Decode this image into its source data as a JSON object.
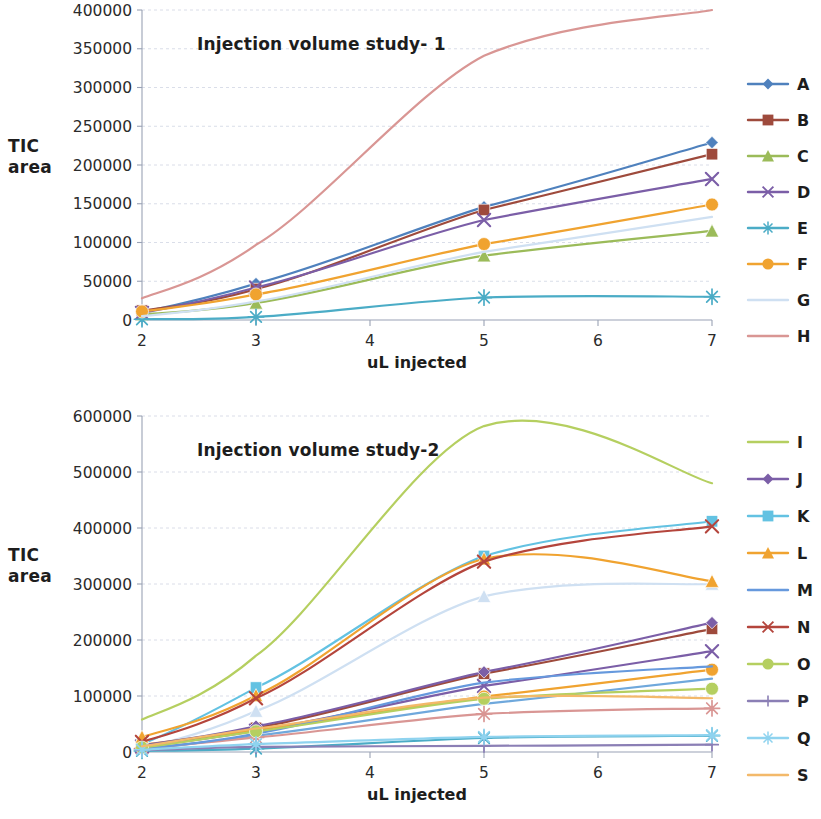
{
  "axis_label_text": "TIC\narea",
  "chart_data": [
    {
      "type": "line",
      "title": "Injection volume  study- 1",
      "xlabel": "uL injected",
      "ylabel": "TIC area",
      "x": [
        2,
        3,
        5,
        7
      ],
      "xlim": [
        2,
        7
      ],
      "ylim": [
        0,
        400000
      ],
      "xticks": [
        2,
        3,
        4,
        5,
        6,
        7
      ],
      "xticklabels": [
        "2",
        "3",
        "4",
        "5",
        "6",
        "7"
      ],
      "yticks": [
        0,
        50000,
        100000,
        150000,
        200000,
        250000,
        300000,
        350000,
        400000
      ],
      "yticklabels": [
        "0",
        "50000",
        "100000",
        "150000",
        "200000",
        "250000",
        "300000",
        "350000",
        "400000"
      ],
      "grid": true,
      "legend_position": "right",
      "series": [
        {
          "name": "A",
          "color": "#4f81bd",
          "marker": "diamond",
          "values": [
            10000,
            47000,
            146000,
            229000
          ]
        },
        {
          "name": "B",
          "color": "#9e4a3c",
          "marker": "square",
          "values": [
            12000,
            40000,
            142000,
            214000
          ]
        },
        {
          "name": "C",
          "color": "#9bbb59",
          "marker": "triangle",
          "values": [
            7000,
            22000,
            83000,
            115000
          ]
        },
        {
          "name": "D",
          "color": "#7b5ea7",
          "marker": "cross",
          "values": [
            9000,
            42000,
            129000,
            182000
          ]
        },
        {
          "name": "E",
          "color": "#4bacc6",
          "marker": "star",
          "values": [
            1000,
            4000,
            29000,
            30000
          ]
        },
        {
          "name": "F",
          "color": "#f0a330",
          "marker": "circle",
          "values": [
            11000,
            33000,
            98000,
            149000
          ]
        },
        {
          "name": "G",
          "color": "#cfe0f2",
          "marker": "none",
          "values": [
            5000,
            24000,
            88000,
            133000
          ]
        },
        {
          "name": "H",
          "color": "#d99694",
          "marker": "none",
          "values": [
            28000,
            97000,
            341000,
            400000
          ]
        }
      ]
    },
    {
      "type": "line",
      "title": "Injection volume  study-2",
      "xlabel": "uL injected",
      "ylabel": "TIC area",
      "x": [
        2,
        3,
        5,
        7
      ],
      "xlim": [
        2,
        7
      ],
      "ylim": [
        0,
        600000
      ],
      "xticks": [
        2,
        3,
        4,
        5,
        6,
        7
      ],
      "xticklabels": [
        "2",
        "3",
        "4",
        "5",
        "6",
        "7"
      ],
      "yticks": [
        0,
        100000,
        200000,
        300000,
        400000,
        500000,
        600000
      ],
      "yticklabels": [
        "0",
        "100000",
        "200000",
        "300000",
        "400000",
        "500000",
        "600000"
      ],
      "grid": true,
      "legend_position": "right",
      "series": [
        {
          "name": "I",
          "color": "#b5cf60",
          "marker": "none",
          "values": [
            58000,
            172000,
            582000,
            480000
          ]
        },
        {
          "name": "J",
          "color": "#7b5ea7",
          "marker": "diamond",
          "values": [
            12000,
            46000,
            143000,
            231000
          ]
        },
        {
          "name": "K",
          "color": "#63c2e2",
          "marker": "square",
          "values": [
            14000,
            115000,
            350000,
            412000
          ]
        },
        {
          "name": "L",
          "color": "#f0a330",
          "marker": "triangle",
          "values": [
            27000,
            101000,
            345000,
            305000
          ]
        },
        {
          "name": "M",
          "color": "#6699dd",
          "marker": "none",
          "values": [
            6000,
            33000,
            124000,
            153000
          ]
        },
        {
          "name": "N",
          "color": "#b4453c",
          "marker": "cross",
          "values": [
            18000,
            96000,
            340000,
            403000
          ]
        },
        {
          "name": "O",
          "color": "#b5cf60",
          "marker": "circle",
          "values": [
            8000,
            37000,
            95000,
            113000
          ]
        },
        {
          "name": "P",
          "color": "#8b7fb5",
          "marker": "plus",
          "values": [
            3000,
            9000,
            11000,
            13000
          ]
        },
        {
          "name": "Q",
          "color": "#8fd3ef",
          "marker": "star",
          "values": [
            4000,
            14000,
            27000,
            30000
          ]
        },
        {
          "name": "S",
          "color": "#f3b96a",
          "marker": "none",
          "values": [
            10000,
            42000,
            97000,
            96000
          ]
        }
      ],
      "extra_series": [
        {
          "name": "unlabeled-light-blue",
          "color": "#cfe0f2",
          "marker": "triangle",
          "values": [
            6000,
            73000,
            278000,
            300000
          ]
        },
        {
          "name": "unlabeled-brown",
          "color": "#9e4a3c",
          "marker": "square",
          "values": [
            11000,
            43000,
            140000,
            220000
          ]
        },
        {
          "name": "unlabeled-purple-x",
          "color": "#7b5ea7",
          "marker": "cross",
          "values": [
            10000,
            38000,
            118000,
            180000
          ]
        },
        {
          "name": "unlabeled-orange-circle",
          "color": "#f0a330",
          "marker": "circle",
          "values": [
            13000,
            40000,
            99000,
            147000
          ]
        },
        {
          "name": "unlabeled-blue-line",
          "color": "#6fa8dc",
          "marker": "none",
          "values": [
            5000,
            29000,
            86000,
            131000
          ]
        },
        {
          "name": "unlabeled-rose",
          "color": "#d99694",
          "marker": "star",
          "values": [
            6000,
            26000,
            68000,
            78000
          ]
        },
        {
          "name": "unlabeled-teal",
          "color": "#4bacc6",
          "marker": "star",
          "values": [
            2000,
            6000,
            25000,
            29000
          ]
        }
      ]
    }
  ]
}
